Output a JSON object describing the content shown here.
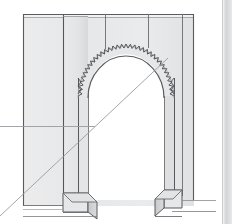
{
  "document": {
    "title": "Architectural elevation drawing of a scalloped horseshoe archway",
    "medium": "pencil / ink line drawing on white paper",
    "subject": "Monumental gateway portal with lobed (scalloped) arch and flanking piers"
  },
  "canvas": {
    "width": 232,
    "height": 224,
    "background_color": "#ffffff",
    "right_margin_band_color": "#d4d4d4",
    "right_margin_band_x": 222
  },
  "palette": {
    "paper": "#ffffff",
    "wall_fill_light": "#ececed",
    "wall_fill_mid": "#e2e3e4",
    "wall_fill_shadow": "#d3d4d6",
    "pier_face_fill": "#e8e9ea",
    "pier_side_fill": "#cfd0d2",
    "base_top_fill": "#dcdddf",
    "opening_fill": "#ffffff",
    "line_dark": "#4a4a4d",
    "line_mid": "#77787b",
    "line_light": "#a9aaad",
    "construction_line": "#9a9b9e"
  },
  "structure": {
    "wall": {
      "label": "Front wall elevation",
      "left_x": 23,
      "right_x": 194,
      "top_y": 14,
      "bottom_y": 206,
      "top_edge_thickness": 3
    },
    "masonry_joints": {
      "label": "Vertical masonry joint lines",
      "lines": [
        {
          "name": "joint-left-pier-edge",
          "x": 63,
          "y_top": 14,
          "y_bottom": 206,
          "full_height": true
        },
        {
          "name": "joint-inner-left",
          "x": 105,
          "y_top": 14,
          "y_bottom": 50,
          "full_height": false
        },
        {
          "name": "joint-inner-right",
          "x": 148,
          "y_top": 14,
          "y_bottom": 48,
          "full_height": false
        }
      ]
    },
    "arch": {
      "label": "Scalloped horseshoe arch opening",
      "type": "lobed-horseshoe",
      "center_x": 126,
      "spring_y": 96,
      "crown_y": 44,
      "outer_radius_x": 48,
      "outer_radius_y": 52,
      "inner_radius_x": 38,
      "inner_radius_y": 42,
      "scallop_count": 34,
      "scallop_depth": 4,
      "jamb_left_outer_x": 78,
      "jamb_left_inner_x": 88,
      "jamb_right_inner_x": 164,
      "jamb_right_outer_x": 174,
      "opening_bottom_y": 200
    },
    "piers": [
      {
        "name": "left-pier",
        "face_left_x": 63,
        "face_right_x": 88,
        "top_y": 14,
        "bottom_y": 200,
        "base": {
          "name": "left-pier-base",
          "top_y": 193,
          "bottom_y": 212,
          "projection_x": 12,
          "projection_y": 10
        }
      },
      {
        "name": "right-pier",
        "face_left_x": 164,
        "face_right_x": 182,
        "top_y": 14,
        "bottom_y": 200,
        "base": {
          "name": "right-pier-base",
          "top_y": 190,
          "bottom_y": 210,
          "projection_x": 12,
          "projection_y": 10
        }
      }
    ],
    "ground_lines": [
      {
        "name": "ground-line-left",
        "x1": 23,
        "y1": 216,
        "x2": 95,
        "y2": 216
      },
      {
        "name": "ground-line-right",
        "x1": 172,
        "y1": 211,
        "x2": 216,
        "y2": 211
      },
      {
        "name": "ground-line-right-upper",
        "x1": 182,
        "y1": 200,
        "x2": 216,
        "y2": 200
      }
    ],
    "construction_lines": [
      {
        "name": "horizontal-datum-line",
        "orientation": "horizontal",
        "x1": 0,
        "y1": 126,
        "x2": 95,
        "y2": 126,
        "description": "Horizontal reference / datum line entering from left page edge"
      },
      {
        "name": "diagonal-sight-line",
        "orientation": "diagonal",
        "x1": 0,
        "y1": 216,
        "x2": 168,
        "y2": 58,
        "description": "Long diagonal construction / perspective sight line running bottom-left to upper-right through the opening"
      }
    ]
  }
}
